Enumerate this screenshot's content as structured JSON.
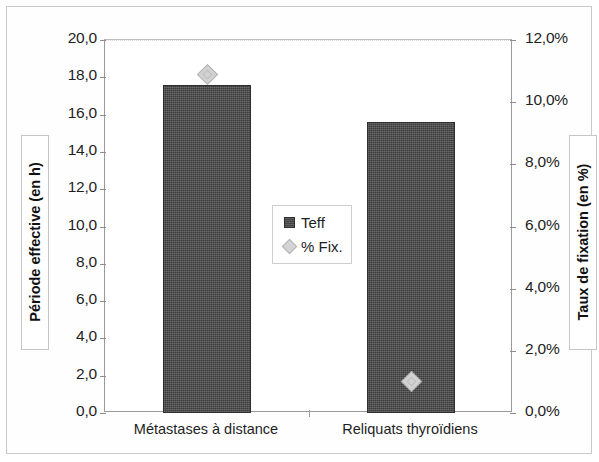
{
  "chart_data": {
    "type": "bar",
    "title": "",
    "subtitle": "",
    "categories": [
      "Métastases à distance",
      "Reliquats thyroïdiens"
    ],
    "series": [
      {
        "name": "Teff",
        "kind": "bar",
        "axis": "left",
        "values": [
          17.6,
          15.6
        ],
        "color": "#4a4a4a",
        "marker": "square"
      },
      {
        "name": "% Fix.",
        "kind": "point",
        "axis": "right",
        "values": [
          10.9,
          1.0
        ],
        "color": "#d2d2d2",
        "marker": "diamond"
      }
    ],
    "xlabel": "",
    "ylabel_left": "Période effective (en h)",
    "ylabel_right": "Taux de fixation (en %)",
    "ylim_left": [
      0,
      20
    ],
    "ylim_right": [
      0,
      12
    ],
    "ytick_step_left": 2,
    "ytick_step_right": 2,
    "yticks_left": [
      "0,0",
      "2,0",
      "4,0",
      "6,0",
      "8,0",
      "10,0",
      "12,0",
      "14,0",
      "16,0",
      "18,0",
      "20,0"
    ],
    "yticks_right": [
      "0,0%",
      "2,0%",
      "4,0%",
      "6,0%",
      "8,0%",
      "10,0%",
      "12,0%"
    ],
    "grid": "top-only",
    "legend_position": "center",
    "legend_entries": [
      "Teff",
      "% Fix."
    ]
  },
  "axes": {
    "left_title": "Période effective (en h)",
    "right_title": "Taux de fixation (en %)"
  },
  "legend": {
    "items": [
      {
        "label": "Teff",
        "marker": "square-marker"
      },
      {
        "label": "% Fix.",
        "marker": "diamond-marker"
      }
    ]
  }
}
